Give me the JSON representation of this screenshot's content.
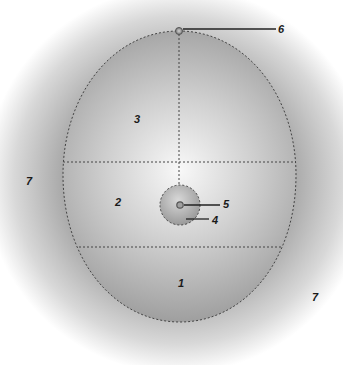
{
  "diagram": {
    "type": "labeled-schematic",
    "shape": "egg-shaped oval divided into three horizontal zones with a central small sphere",
    "colors": {
      "halo_inner": "#8f8f8f",
      "halo_outer": "#ffffff",
      "oval_center": "#f4f4f4",
      "oval_edge": "#9a9a9a",
      "dashed_line": "#444444",
      "leader_line": "#222222",
      "label_text": "#1a1a1a"
    },
    "labels": [
      {
        "id": "label-1",
        "text": "1",
        "region": "lower zone of oval"
      },
      {
        "id": "label-2",
        "text": "2",
        "region": "middle zone of oval"
      },
      {
        "id": "label-3",
        "text": "3",
        "region": "upper zone of oval"
      },
      {
        "id": "label-4",
        "text": "4",
        "region": "small central sphere"
      },
      {
        "id": "label-5",
        "text": "5",
        "region": "center dot of small sphere"
      },
      {
        "id": "label-6",
        "text": "6",
        "region": "apex point of oval"
      },
      {
        "id": "label-7a",
        "text": "7",
        "region": "outer halo, left"
      },
      {
        "id": "label-7b",
        "text": "7",
        "region": "outer halo, lower right"
      }
    ]
  }
}
